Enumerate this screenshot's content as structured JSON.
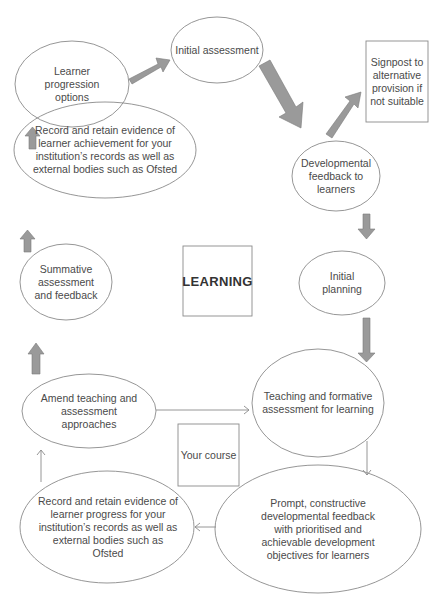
{
  "diagram": {
    "center_label": "LEARNING",
    "course_label": "Your course",
    "nodes": {
      "initial_assessment": "Initial assessment",
      "signpost": "Signpost to alternative provision if not suitable",
      "developmental_feedback": "Developmental feedback to learners",
      "initial_planning": "Initial planning",
      "teaching_formative": "Teaching and formative assessment for learning",
      "prompt_feedback": "Prompt, constructive developmental feedback with prioritised and achievable development objectives for learners",
      "record_progress": "Record and retain evidence of learner progress for your institution’s records as well as external bodies such as Ofsted",
      "amend_teaching": "Amend teaching and assessment approaches",
      "summative": "Summative assessment and feedback",
      "record_achievement": "Record and retain evidence of learner achievement for your institution’s records as well as external bodies such as Ofsted",
      "progression_options": "Learner progression options"
    },
    "colors": {
      "outline": "#8a8a8a",
      "arrow_fill": "#9a9a9a",
      "text": "#4a4a4a"
    }
  }
}
